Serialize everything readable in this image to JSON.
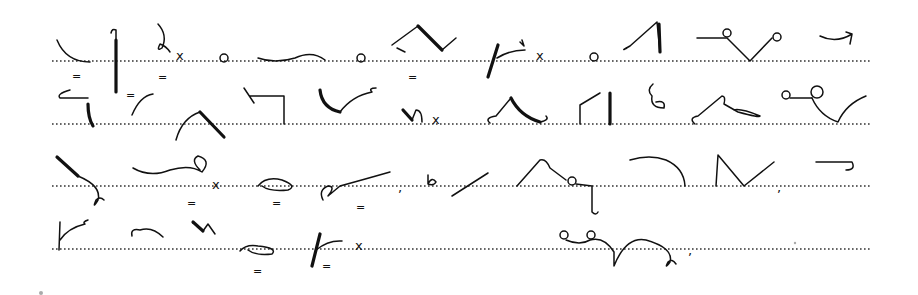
{
  "document": {
    "type": "shorthand-exercise",
    "description": "Handwritten Pitman-style shorthand outlines on four dotted ruled lines",
    "ink_color": "#111111",
    "rule_color": "#333333",
    "background": "#ffffff"
  },
  "lines": [
    {
      "index": 1,
      "y": 61,
      "outline_count": 14,
      "marks": [
        "x",
        "o",
        "o",
        "=",
        "=",
        "x",
        "o"
      ]
    },
    {
      "index": 2,
      "y": 124,
      "outline_count": 13,
      "marks": [
        "=",
        "=",
        "=",
        "x"
      ]
    },
    {
      "index": 3,
      "y": 186,
      "outline_count": 12,
      "marks": [
        "x",
        "=",
        "=",
        "=",
        ",",
        ",",
        ","
      ]
    },
    {
      "index": 4,
      "y": 249,
      "outline_count": 7,
      "marks": [
        "=",
        "=",
        "x",
        ","
      ]
    }
  ],
  "glyphs": {
    "cross": "x",
    "circle": "o",
    "double_dash": "=",
    "comma": ","
  }
}
